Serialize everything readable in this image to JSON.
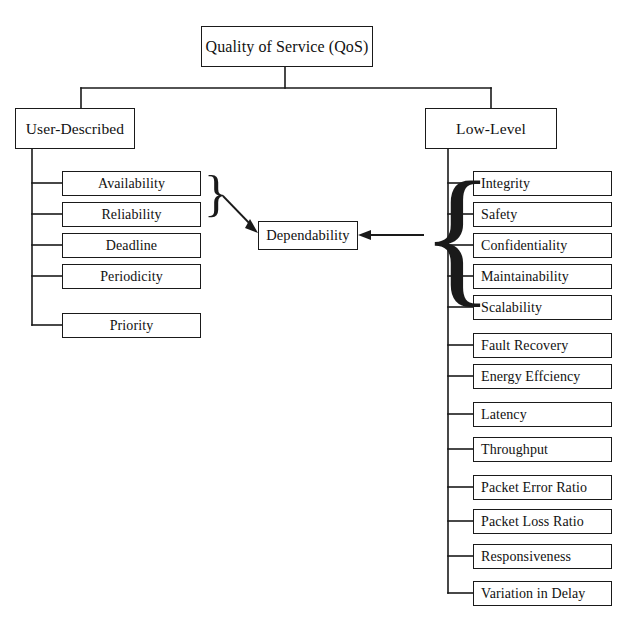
{
  "diagram": {
    "root": {
      "label": "Quality of Service (QoS)"
    },
    "branches": [
      {
        "id": "user-described",
        "label": "User-Described"
      },
      {
        "id": "low-level",
        "label": "Low-Level"
      }
    ],
    "user_described_leaves": [
      {
        "label": "Availability"
      },
      {
        "label": "Reliability"
      },
      {
        "label": "Deadline"
      },
      {
        "label": "Periodicity"
      },
      {
        "label": "Priority"
      }
    ],
    "low_level_leaves": [
      {
        "label": "Integrity"
      },
      {
        "label": "Safety"
      },
      {
        "label": "Confidentiality"
      },
      {
        "label": "Maintainability"
      },
      {
        "label": "Scalability"
      },
      {
        "label": "Fault Recovery"
      },
      {
        "label": "Energy Effciency"
      },
      {
        "label": "Latency"
      },
      {
        "label": "Throughput"
      },
      {
        "label": "Packet Error Ratio"
      },
      {
        "label": "Packet Loss Ratio"
      },
      {
        "label": "Responsiveness"
      },
      {
        "label": "Variation in Delay"
      }
    ],
    "aggregate": {
      "label": "Dependability"
    },
    "braces": {
      "left_brace": "}",
      "right_brace": "{"
    },
    "colors": {
      "line": "#1a1a1a",
      "box_fill": "#ffffff",
      "text": "#111111",
      "background": "#ffffff"
    },
    "caption": ""
  }
}
